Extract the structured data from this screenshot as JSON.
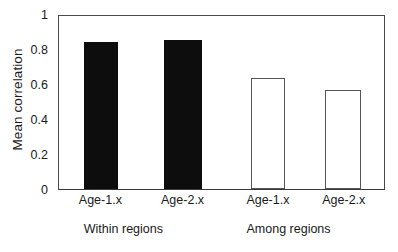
{
  "chart_data": {
    "type": "bar",
    "title": "",
    "subtitle": "",
    "xlabel": "",
    "ylabel": "Mean correlation",
    "ylim": [
      0,
      1
    ],
    "y_ticks": [
      "0",
      "0.2",
      "0.4",
      "0.6",
      "0.8",
      "1"
    ],
    "y_tick_values": [
      0,
      0.2,
      0.4,
      0.6,
      0.8,
      1
    ],
    "grid": false,
    "legend": "none",
    "categories": [
      "Age-1.x",
      "Age-2.x",
      "Age-1.x",
      "Age-2.x"
    ],
    "values": [
      0.85,
      0.86,
      0.64,
      0.57
    ],
    "bar_styles": [
      "filled",
      "filled",
      "hollow",
      "hollow"
    ],
    "groups": [
      {
        "label": "Within regions",
        "category_indices": [
          0,
          1
        ]
      },
      {
        "label": "Among regions",
        "category_indices": [
          2,
          3
        ]
      }
    ],
    "annotations": [],
    "colors": {
      "filled_bar": "#0d0d0d",
      "hollow_bar_fill": "#ffffff",
      "hollow_bar_stroke": "#555555",
      "axis": "#4a4a4a",
      "text": "#1a1a1a",
      "background": "#ffffff"
    },
    "bar_geometry": [
      {
        "center_pct": 7.6,
        "width_pct": 10.7
      },
      {
        "center_pct": 32.3,
        "width_pct": 11.6
      },
      {
        "center_pct": 59.0,
        "width_pct": 10.4
      },
      {
        "center_pct": 81.9,
        "width_pct": 11.0
      }
    ],
    "group_geometry": [
      {
        "center_pct": 20.0
      },
      {
        "center_pct": 70.5
      }
    ]
  }
}
